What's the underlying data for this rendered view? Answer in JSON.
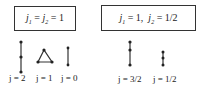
{
  "boxes": [
    {
      "label_parts": [
        "j",
        "1",
        " = ",
        "j",
        "2",
        " = 1"
      ],
      "text": "j1 = j2 = 1"
    },
    {
      "text": "j1 = 1, j2 = 1/2"
    }
  ],
  "left_group": {
    "labels": [
      "j = 2",
      "j = 1",
      "j = 0"
    ]
  },
  "right_group": {
    "labels": [
      "j = 3/2",
      "j = 1/2"
    ]
  },
  "text": {
    "eq": "=",
    "j": "j",
    "sub1": "1",
    "sub2": "2",
    "one": "1",
    "half": "1/2",
    "threehalf": "3/2",
    "two": "2",
    "zero": "0",
    "comma": ","
  }
}
